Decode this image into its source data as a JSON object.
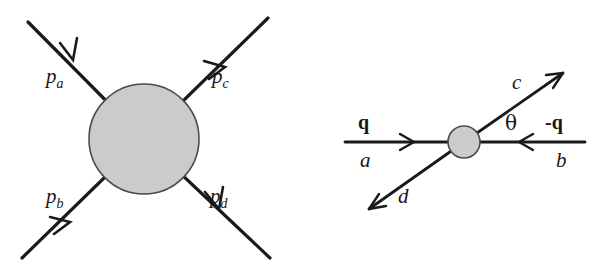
{
  "figure": {
    "background_color": "#ffffff",
    "line_color": "#1a1a1a",
    "blob_fill_color": "#cbcbcb",
    "blob_stroke_color": "#4a4a4a"
  },
  "left_diagram": {
    "name": "general-scattering-blob",
    "blob": {
      "center_x": 144,
      "center_y": 139,
      "radius": 55
    },
    "labels": {
      "p_a": {
        "text": "p",
        "sub": "a"
      },
      "p_b": {
        "text": "p",
        "sub": "b"
      },
      "p_c": {
        "text": "p",
        "sub": "c"
      },
      "p_d": {
        "text": "p",
        "sub": "d"
      }
    },
    "legs": [
      {
        "name": "leg-pa",
        "from": [
          28,
          22
        ],
        "to": [
          144,
          139
        ],
        "direction": "incoming"
      },
      {
        "name": "leg-pb",
        "from": [
          22,
          258
        ],
        "to": [
          144,
          139
        ],
        "direction": "incoming"
      },
      {
        "name": "leg-pc",
        "from": [
          144,
          139
        ],
        "to": [
          268,
          18
        ],
        "direction": "outgoing"
      },
      {
        "name": "leg-pd",
        "from": [
          144,
          139
        ],
        "to": [
          270,
          258
        ],
        "direction": "outgoing"
      }
    ]
  },
  "right_diagram": {
    "name": "center-of-mass-scattering",
    "blob": {
      "center_x": 464,
      "center_y": 142,
      "radius": 16
    },
    "labels": {
      "q": "q",
      "minus_q": "-q",
      "a": "a",
      "b": "b",
      "c": "c",
      "d": "d",
      "theta": "θ"
    },
    "legs": [
      {
        "name": "leg-a",
        "from": [
          345,
          142
        ],
        "to": [
          464,
          142
        ],
        "direction": "incoming"
      },
      {
        "name": "leg-b",
        "from": [
          585,
          142
        ],
        "to": [
          464,
          142
        ],
        "direction": "incoming"
      },
      {
        "name": "leg-c",
        "from": [
          464,
          142
        ],
        "to": [
          563,
          73
        ],
        "direction": "outgoing"
      },
      {
        "name": "leg-d",
        "from": [
          464,
          142
        ],
        "to": [
          369,
          209
        ],
        "direction": "outgoing"
      }
    ]
  }
}
